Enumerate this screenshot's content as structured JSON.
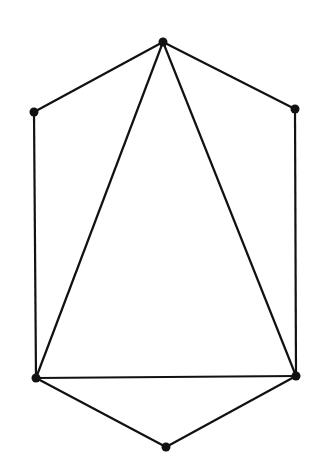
{
  "diagram": {
    "type": "graph",
    "stroke_color": "#111111",
    "vertices": [
      {
        "id": "top",
        "x": 163,
        "y": 42
      },
      {
        "id": "upper-left",
        "x": 34,
        "y": 112
      },
      {
        "id": "upper-right",
        "x": 295,
        "y": 109
      },
      {
        "id": "lower-left",
        "x": 36,
        "y": 378
      },
      {
        "id": "lower-right",
        "x": 296,
        "y": 376
      },
      {
        "id": "bottom",
        "x": 166,
        "y": 447
      }
    ],
    "edges": [
      [
        "top",
        "upper-left"
      ],
      [
        "top",
        "upper-right"
      ],
      [
        "upper-left",
        "lower-left"
      ],
      [
        "upper-right",
        "lower-right"
      ],
      [
        "top",
        "lower-left"
      ],
      [
        "top",
        "lower-right"
      ],
      [
        "lower-left",
        "lower-right"
      ],
      [
        "lower-left",
        "bottom"
      ],
      [
        "lower-right",
        "bottom"
      ]
    ]
  }
}
